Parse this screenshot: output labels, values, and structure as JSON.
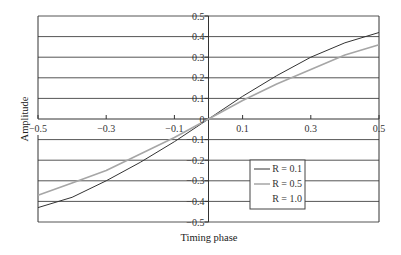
{
  "chart_data": {
    "type": "line",
    "title": "",
    "xlabel": "Timing phase",
    "ylabel": "Amplitude",
    "xlim": [
      -0.5,
      0.5
    ],
    "ylim": [
      -0.5,
      0.5
    ],
    "grid": true,
    "x_ticks": [
      "-0.5",
      "-0.3",
      "-0.1",
      "0.1",
      "0.3",
      "0.5"
    ],
    "y_ticks": [
      "0.5",
      "0.4",
      "0.3",
      "0.2",
      "0.1",
      "0",
      "-0.1",
      "-0.2",
      "-0.3",
      "-0.4",
      "-0.5"
    ],
    "legend_position": "lower right inside",
    "x": [
      -0.5,
      -0.4,
      -0.3,
      -0.2,
      -0.1,
      0,
      0.1,
      0.2,
      0.3,
      0.4,
      0.5
    ],
    "series": [
      {
        "name": "R = 0.1",
        "color": "#333333",
        "values": [
          -0.43,
          -0.38,
          -0.3,
          -0.21,
          -0.11,
          0,
          0.11,
          0.21,
          0.3,
          0.37,
          0.42
        ]
      },
      {
        "name": "R = 0.5",
        "color": "#a6a6a6",
        "values": [
          -0.37,
          -0.31,
          -0.25,
          -0.17,
          -0.09,
          0,
          0.09,
          0.17,
          0.24,
          0.31,
          0.36
        ]
      },
      {
        "name": "R = 1.0",
        "color": "#ffffff",
        "values": [
          0,
          0,
          0,
          0,
          0,
          0,
          0,
          0,
          0,
          0,
          0
        ]
      }
    ]
  },
  "legend": {
    "items": [
      {
        "label": "R = 0.1"
      },
      {
        "label": "R = 0.5"
      },
      {
        "label": "R = 1.0"
      }
    ]
  },
  "axes": {
    "xlabel": "Timing phase",
    "ylabel": "Amplitude"
  }
}
